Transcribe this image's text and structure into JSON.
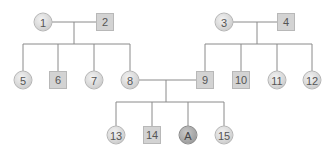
{
  "diagram": {
    "type": "pedigree",
    "individuals": [
      {
        "id": "1",
        "label": "1",
        "sex": "female",
        "generation": 1,
        "x": 43,
        "y": 22
      },
      {
        "id": "2",
        "label": "2",
        "sex": "male",
        "generation": 1,
        "x": 105,
        "y": 22
      },
      {
        "id": "3",
        "label": "3",
        "sex": "female",
        "generation": 1,
        "x": 224,
        "y": 22
      },
      {
        "id": "4",
        "label": "4",
        "sex": "male",
        "generation": 1,
        "x": 286,
        "y": 22
      },
      {
        "id": "5",
        "label": "5",
        "sex": "female",
        "generation": 2,
        "x": 23,
        "y": 80
      },
      {
        "id": "6",
        "label": "6",
        "sex": "male",
        "generation": 2,
        "x": 58,
        "y": 80
      },
      {
        "id": "7",
        "label": "7",
        "sex": "female",
        "generation": 2,
        "x": 94,
        "y": 80
      },
      {
        "id": "8",
        "label": "8",
        "sex": "female",
        "generation": 2,
        "x": 130,
        "y": 80
      },
      {
        "id": "9",
        "label": "9",
        "sex": "male",
        "generation": 2,
        "x": 205,
        "y": 80
      },
      {
        "id": "10",
        "label": "10",
        "sex": "male",
        "generation": 2,
        "x": 241,
        "y": 80
      },
      {
        "id": "11",
        "label": "11",
        "sex": "female",
        "generation": 2,
        "x": 277,
        "y": 80
      },
      {
        "id": "12",
        "label": "12",
        "sex": "female",
        "generation": 2,
        "x": 312,
        "y": 80
      },
      {
        "id": "13",
        "label": "13",
        "sex": "female",
        "generation": 3,
        "x": 116,
        "y": 135
      },
      {
        "id": "14",
        "label": "14",
        "sex": "male",
        "generation": 3,
        "x": 152,
        "y": 135
      },
      {
        "id": "A",
        "label": "A",
        "sex": "female",
        "generation": 3,
        "x": 188,
        "y": 135,
        "highlighted": true
      },
      {
        "id": "15",
        "label": "15",
        "sex": "female",
        "generation": 3,
        "x": 224,
        "y": 135
      }
    ],
    "couples": [
      {
        "partners": [
          "1",
          "2"
        ],
        "children": [
          "5",
          "6",
          "7",
          "8"
        ]
      },
      {
        "partners": [
          "3",
          "4"
        ],
        "children": [
          "9",
          "10",
          "11",
          "12"
        ]
      },
      {
        "partners": [
          "8",
          "9"
        ],
        "children": [
          "13",
          "14",
          "A",
          "15"
        ]
      }
    ],
    "colors": {
      "line": "#8a8a8a",
      "node_fill": "#d6d6d6",
      "highlight_fill": "#a6a6a6",
      "text": "#555555"
    }
  }
}
